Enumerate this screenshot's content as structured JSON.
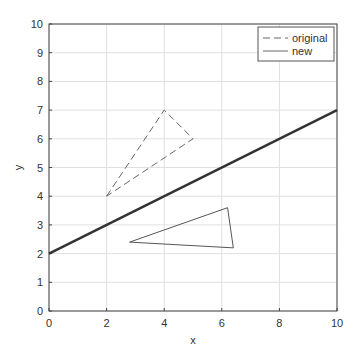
{
  "chart_data": {
    "type": "line",
    "title": "",
    "xlabel": "x",
    "ylabel": "y",
    "xlim": [
      0,
      10
    ],
    "ylim": [
      0,
      10
    ],
    "xticks": [
      0,
      2,
      4,
      6,
      8,
      10
    ],
    "yticks": [
      0,
      1,
      2,
      3,
      4,
      5,
      6,
      7,
      8,
      9,
      10
    ],
    "grid": true,
    "legend": {
      "position": "upper right",
      "entries": [
        "original",
        "new"
      ]
    },
    "series": [
      {
        "name": "original",
        "style": "dashed",
        "color": "#666666",
        "points": [
          [
            2,
            4
          ],
          [
            4,
            7
          ],
          [
            5,
            6
          ],
          [
            2,
            4
          ]
        ]
      },
      {
        "name": "new",
        "style": "solid",
        "color": "#555555",
        "points": [
          [
            2.8,
            2.4
          ],
          [
            6.2,
            3.6
          ],
          [
            6.4,
            2.2
          ],
          [
            2.8,
            2.4
          ]
        ]
      },
      {
        "name": "line",
        "style": "solid-thick",
        "color": "#333333",
        "points": [
          [
            0,
            2
          ],
          [
            10,
            7
          ]
        ]
      }
    ]
  }
}
